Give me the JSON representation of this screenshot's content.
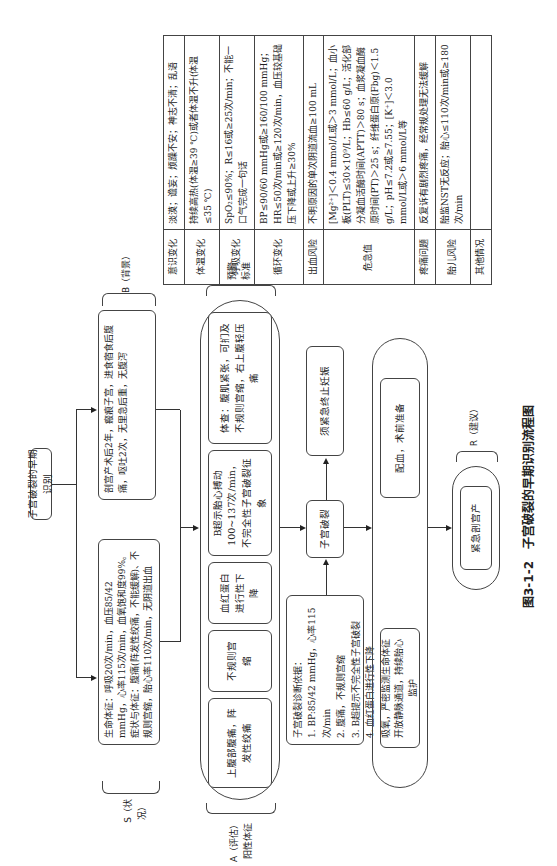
{
  "root": {
    "label": "子宫破裂的早期识别"
  },
  "situation": {
    "brace_label": "S（状况）",
    "text": "生命体征：呼吸20次/min，血压85/42 mmHg，心率115次/min，血氧饱和度99%。症状与体征：腹痛(阵发性绞痛，不能缓解)、不规则宫缩，胎心率110次/min，无阴道出血"
  },
  "background": {
    "brace_label": "B（背景）",
    "text": "剖宫产术后2年，瘢痕子宫，进食宿食后腹痛，呕吐2次，无里急后重，无腹泻"
  },
  "assessment": {
    "brace_label_1": "A（评估）",
    "brace_label_2": "阳性体征",
    "signs": [
      "上腹部腹痛，阵发性绞痛",
      "不规则宫缩",
      "血红蛋白进行性下降",
      "B超示胎心搏动100~137次/min，不完全性子宫破裂征象",
      "体查：腹肌紧张，可扪及不规则宫缩，右上腹轻压痛"
    ]
  },
  "warning": {
    "label_1": "预警",
    "label_2": "标准",
    "rows": [
      {
        "key": "意识变化",
        "value": "淡漠；谵妄；烦躁不安；神志不清；乱语"
      },
      {
        "key": "体温变化",
        "value": "持续高热(体温≥39 ℃)或者体温不升(体温≤35 ℃)"
      },
      {
        "key": "呼吸变化",
        "value": "SpO₂≤90%；R≤16或≥25次/min；不能一口气完成一句话"
      },
      {
        "key": "循环变化",
        "value": "BP≤90/60 mmHg或≥160/100 mmHg；HR≤50次/min或≥120次/min，血压较基础压下降或上升≥30%"
      },
      {
        "key": "出血风险",
        "value": "不明原因的单次阴道流血≥100 mL"
      },
      {
        "key": "危急值",
        "value": "[Mg²⁺]＜0.4 mmol/L或＞3 mmol/L；血小板(PLT)≤30×10⁹/L；Hb≤60 g/L；活化部分凝血活酶时间(APTT)＞80 s；血浆凝血酶原时间(PT)＞25 s；纤维蛋白原(Fbg)＜1.5 g/L；pH≤7.2或≥7.55；[K⁺]＜3.0 mmol/L或＞6 mmol/L等"
      },
      {
        "key": "疼痛问题",
        "value": "反复诉有剧烈疼痛，经常规处理无法缓解"
      },
      {
        "key": "胎儿风险",
        "value": "胎监NST无反应；胎心≤110次/min或≥180次/min"
      },
      {
        "key": "其他情况",
        "value": ""
      }
    ]
  },
  "diagnosis": {
    "title": "子宫破裂诊断依据：",
    "items": [
      "1. BP:85/42 mmHg，心率115次/min",
      "2. 腹痛，不规则宫缩",
      "3. B超提示不完全性子宫破裂",
      "4. 血红蛋白进行性下降"
    ]
  },
  "rupture": {
    "label": "子宫破裂"
  },
  "terminate": {
    "label": "须紧急终止妊娠"
  },
  "actions": {
    "monitor": "吸氧，严密监测生命体征开放静脉通道，持续胎心监护",
    "prepare": "配血，术前准备"
  },
  "recommendation": {
    "brace_label": "R（建议）",
    "label": "紧急剖宫产"
  },
  "caption": "图3-1-2　子宫破裂的早期识别流程图"
}
